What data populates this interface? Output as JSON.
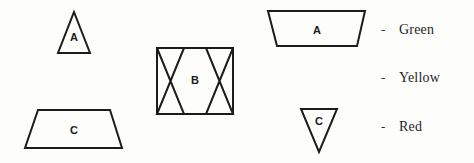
{
  "figure": {
    "background_color": "#fdfdfc",
    "stroke_color": "#1c1c1c",
    "shapes": [
      {
        "id": "triangle-a-left",
        "label": "A",
        "kind": "triangle-up",
        "label_x": 74,
        "label_y": 38
      },
      {
        "id": "trapezoid-c-left",
        "label": "C",
        "kind": "trapezoid-down",
        "label_x": 74,
        "label_y": 131
      },
      {
        "id": "bowtie-rect-b-center",
        "label": "B",
        "kind": "rectangle-with-bowties",
        "label_x": 195,
        "label_y": 81
      },
      {
        "id": "trapezoid-a-right",
        "label": "A",
        "kind": "trapezoid-inverted",
        "label_x": 317,
        "label_y": 31
      },
      {
        "id": "triangle-c-right",
        "label": "C",
        "kind": "triangle-down",
        "label_x": 319,
        "label_y": 122
      }
    ]
  },
  "legend": {
    "dash": "-",
    "items": [
      {
        "label": "Green",
        "color": "#008000",
        "y": 31
      },
      {
        "label": "Yellow",
        "color": "#ffd700",
        "y": 79
      },
      {
        "label": "Red",
        "color": "#ff0000",
        "y": 128
      }
    ]
  }
}
